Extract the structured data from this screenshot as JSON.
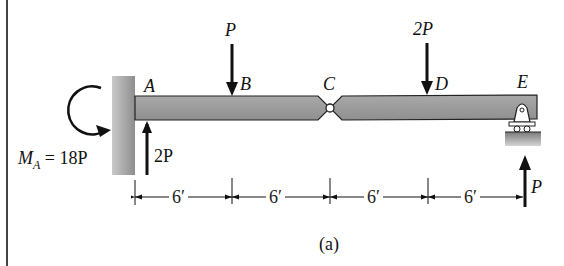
{
  "figure": {
    "caption": "(a)",
    "points": [
      {
        "id": "A",
        "label": "A"
      },
      {
        "id": "B",
        "label": "B"
      },
      {
        "id": "C",
        "label": "C"
      },
      {
        "id": "D",
        "label": "D"
      },
      {
        "id": "E",
        "label": "E"
      }
    ],
    "loads": {
      "at_B": "P",
      "at_D": "2P"
    },
    "reactions": {
      "moment_A": "M_A = 18P",
      "moment_A_main": "M",
      "moment_A_sub": "A",
      "moment_A_value": " = 18P",
      "force_A": "2P",
      "force_E": "P"
    },
    "dimensions": [
      "6′",
      "6′",
      "6′",
      "6′"
    ],
    "supports": {
      "A": "fixed wall",
      "C": "hinge",
      "E": "roller"
    }
  },
  "colors": {
    "beam": "#9a9a9a",
    "beam_edge": "#222222",
    "wall": "#a8a8a8",
    "ground": "#9c9c9c",
    "line": "#111111"
  }
}
